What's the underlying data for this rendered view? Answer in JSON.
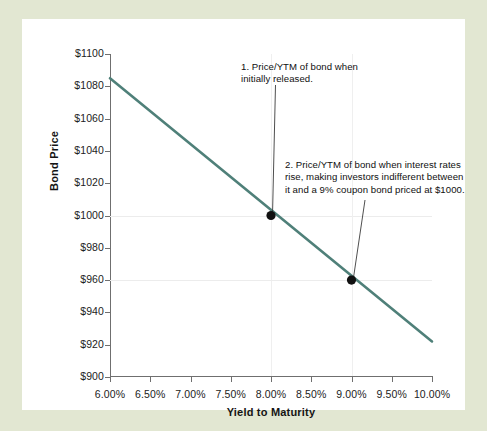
{
  "figure": {
    "frame_color": "#e2e7d2",
    "card_color": "#ffffff"
  },
  "chart_data": {
    "type": "line",
    "title": "",
    "xlabel": "Yield to Maturity",
    "ylabel": "Bond Price",
    "xlim": [
      6.0,
      10.0
    ],
    "ylim": [
      900,
      1100
    ],
    "grid": "faint, only at highlighted values",
    "legend": "none",
    "line_color": "#4f8079",
    "marker_color": "#111111",
    "x_tick_labels": [
      "6.00%",
      "6.50%",
      "7.00%",
      "7.50%",
      "8.00%",
      "8.50%",
      "9.00%",
      "9.50%",
      "10.00%"
    ],
    "x_tick_values": [
      6.0,
      6.5,
      7.0,
      7.5,
      8.0,
      8.5,
      9.0,
      9.5,
      10.0
    ],
    "y_tick_labels": [
      "$1100",
      "$1080",
      "$1060",
      "$1040",
      "$1020",
      "$1000",
      "$980",
      "$960",
      "$940",
      "$920",
      "$900"
    ],
    "y_tick_values": [
      1100,
      1080,
      1060,
      1040,
      1020,
      1000,
      980,
      960,
      940,
      920,
      900
    ],
    "series": [
      {
        "name": "Bond Price",
        "x": [
          6.0,
          10.0
        ],
        "y": [
          1085,
          922
        ]
      }
    ],
    "points": [
      {
        "label": "1",
        "x": 8.0,
        "y": 1000,
        "x_display": "8.00%",
        "y_display": "$1000"
      },
      {
        "label": "2",
        "x": 9.0,
        "y": 960,
        "x_display": "9.00%",
        "y_display": "$960"
      }
    ],
    "annotations": [
      {
        "id": "1",
        "text": "1. Price/YTM of bond when initially released.",
        "lines": [
          "1. Price/YTM of bond when",
          "initially released."
        ],
        "points_to": {
          "x": 8.0,
          "y": 1000
        }
      },
      {
        "id": "2",
        "text": "2. Price/YTM of bond when interest rates rise, making investors indifferent between it and a 9% coupon bond priced at $1000.",
        "lines": [
          "2. Price/YTM of bond when interest rates",
          "rise, making investors indifferent between",
          "it and a 9% coupon bond priced at $1000."
        ],
        "points_to": {
          "x": 9.0,
          "y": 960
        }
      }
    ]
  }
}
